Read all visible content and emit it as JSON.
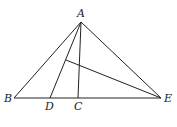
{
  "diagram": {
    "points": {
      "A": {
        "label": "A",
        "x": 81,
        "y": 22
      },
      "B": {
        "label": "B",
        "x": 14,
        "y": 98
      },
      "D": {
        "label": "D",
        "x": 50,
        "y": 98
      },
      "C": {
        "label": "C",
        "x": 78,
        "y": 98
      },
      "E": {
        "label": "E",
        "x": 161,
        "y": 98
      },
      "F": {
        "label": "",
        "x": 66,
        "y": 60
      }
    },
    "segments": [
      [
        "A",
        "B"
      ],
      [
        "A",
        "E"
      ],
      [
        "B",
        "E"
      ],
      [
        "A",
        "D"
      ],
      [
        "A",
        "C"
      ],
      [
        "F",
        "E"
      ]
    ],
    "line_color": "#222222"
  }
}
